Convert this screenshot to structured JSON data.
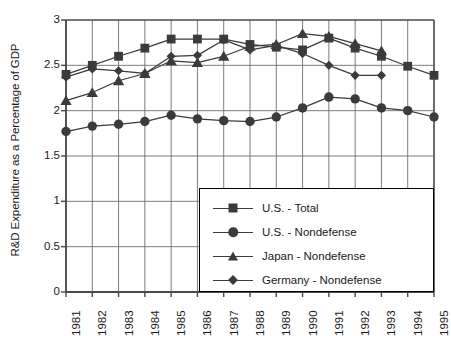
{
  "chart_data": {
    "type": "line",
    "title": "",
    "xlabel": "",
    "ylabel": "R&D Expenditure as a Percentage of GDP",
    "categories": [
      "1981",
      "1982",
      "1983",
      "1984",
      "1985",
      "1986",
      "1987",
      "1988",
      "1989",
      "1990",
      "1991",
      "1992",
      "1993",
      "1994",
      "1995"
    ],
    "x": [
      1981,
      1982,
      1983,
      1984,
      1985,
      1986,
      1987,
      1988,
      1989,
      1990,
      1991,
      1992,
      1993,
      1994,
      1995
    ],
    "ylim": [
      0,
      3
    ],
    "xlim": [
      1981,
      1995
    ],
    "yticks": [
      0,
      0.5,
      1,
      1.5,
      2,
      2.5,
      3
    ],
    "ytick_labels": [
      "0",
      "0.5",
      "1",
      "1.5",
      "2",
      "2.5",
      "3"
    ],
    "grid": true,
    "grid_axis": "both",
    "legend_position": "bottom-right",
    "series": [
      {
        "name": "U.S. - Total",
        "marker": "square",
        "color": "#3b3b3b",
        "values": [
          2.4,
          2.5,
          2.6,
          2.69,
          2.79,
          2.79,
          2.79,
          2.73,
          2.7,
          2.67,
          2.8,
          2.69,
          2.6,
          2.49,
          2.39
        ]
      },
      {
        "name": "U.S. - Nondefense",
        "marker": "circle",
        "color": "#3b3b3b",
        "values": [
          1.77,
          1.83,
          1.85,
          1.88,
          1.95,
          1.91,
          1.89,
          1.88,
          1.93,
          2.03,
          2.15,
          2.13,
          2.03,
          2.0,
          1.93
        ]
      },
      {
        "name": "Japan - Nondefense",
        "marker": "triangle",
        "color": "#3b3b3b",
        "values": [
          2.11,
          2.2,
          2.33,
          2.41,
          2.55,
          2.53,
          2.6,
          2.71,
          2.73,
          2.85,
          2.82,
          2.74,
          2.66,
          null,
          null
        ]
      },
      {
        "name": "Germany - Nondefense",
        "marker": "diamond",
        "color": "#3b3b3b",
        "values": [
          2.37,
          2.46,
          2.44,
          2.41,
          2.6,
          2.61,
          2.78,
          2.67,
          2.72,
          2.63,
          2.5,
          2.39,
          2.39,
          null,
          null
        ]
      }
    ]
  },
  "colors": {
    "line": "#3b3b3b",
    "axis": "#4a4a4a",
    "grid": "#6e6e6e",
    "text": "#1a1a1a",
    "background": "#ffffff"
  }
}
